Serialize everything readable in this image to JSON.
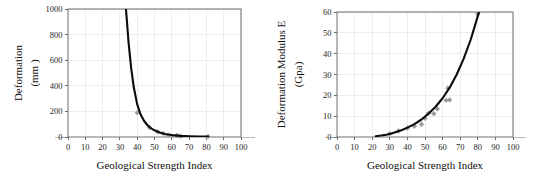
{
  "figure": {
    "title": "",
    "panel_count": 2
  },
  "chart_data": [
    {
      "type": "scatter",
      "panel": "left",
      "title": "",
      "xlabel": "Geological Strength Index",
      "ylabel": "Deformation",
      "ylabel_units": "(mm )",
      "xlim": [
        0,
        100
      ],
      "ylim": [
        0,
        1000
      ],
      "xticks": [
        0,
        10,
        20,
        30,
        40,
        50,
        60,
        70,
        80,
        90,
        100
      ],
      "yticks": [
        0,
        200,
        400,
        600,
        800,
        1000
      ],
      "grid": true,
      "legend": "none",
      "series": [
        {
          "name": "Deformation data points",
          "marker": "diamond",
          "marker_color": "#9a9a9c",
          "points": [
            {
              "x": 40,
              "y": 190
            },
            {
              "x": 47,
              "y": 75
            },
            {
              "x": 52,
              "y": 38
            },
            {
              "x": 55,
              "y": 28
            },
            {
              "x": 58,
              "y": 14
            },
            {
              "x": 63,
              "y": 12
            },
            {
              "x": 65,
              "y": 6
            },
            {
              "x": 81,
              "y": 3
            }
          ]
        },
        {
          "name": "Fitted deformation curve",
          "marker": "none",
          "line_color": "#0b0b0b",
          "points": [
            {
              "x": 33.5,
              "y": 1000
            },
            {
              "x": 35,
              "y": 740
            },
            {
              "x": 36.5,
              "y": 540
            },
            {
              "x": 38,
              "y": 390
            },
            {
              "x": 40,
              "y": 255
            },
            {
              "x": 42,
              "y": 175
            },
            {
              "x": 44,
              "y": 125
            },
            {
              "x": 46,
              "y": 92
            },
            {
              "x": 48,
              "y": 68
            },
            {
              "x": 50,
              "y": 52
            },
            {
              "x": 53,
              "y": 35
            },
            {
              "x": 56,
              "y": 24
            },
            {
              "x": 60,
              "y": 15
            },
            {
              "x": 65,
              "y": 9
            },
            {
              "x": 70,
              "y": 6
            },
            {
              "x": 75,
              "y": 4
            },
            {
              "x": 81,
              "y": 3
            }
          ]
        }
      ]
    },
    {
      "type": "scatter",
      "panel": "right",
      "title": "",
      "xlabel": "Geological Strength Index",
      "ylabel": "Deformation Modulus E",
      "ylabel_units": "(Gpa)",
      "xlim": [
        0,
        100
      ],
      "ylim": [
        0,
        60
      ],
      "xticks": [
        0,
        10,
        20,
        30,
        40,
        50,
        60,
        70,
        80,
        90,
        100
      ],
      "yticks": [
        0,
        10,
        20,
        30,
        40,
        50,
        60
      ],
      "grid": true,
      "legend": "none",
      "series": [
        {
          "name": "Deformation modulus data points",
          "marker": "diamond",
          "marker_color": "#9a9a9c",
          "points": [
            {
              "x": 30,
              "y": 1.6
            },
            {
              "x": 35,
              "y": 2.9
            },
            {
              "x": 40,
              "y": 4.3
            },
            {
              "x": 44,
              "y": 5.2
            },
            {
              "x": 48,
              "y": 6.1
            },
            {
              "x": 50,
              "y": 9.0
            },
            {
              "x": 52,
              "y": 11.5
            },
            {
              "x": 55,
              "y": 11.2
            },
            {
              "x": 57,
              "y": 13.5
            },
            {
              "x": 62,
              "y": 17.6
            },
            {
              "x": 64,
              "y": 17.8
            },
            {
              "x": 63,
              "y": 23.5
            },
            {
              "x": 80,
              "y": 59.0
            }
          ]
        },
        {
          "name": "Fitted modulus curve",
          "marker": "none",
          "line_color": "#0b0b0b",
          "points": [
            {
              "x": 22,
              "y": 0.4
            },
            {
              "x": 25,
              "y": 0.7
            },
            {
              "x": 28,
              "y": 1.1
            },
            {
              "x": 31,
              "y": 1.7
            },
            {
              "x": 34,
              "y": 2.5
            },
            {
              "x": 37,
              "y": 3.4
            },
            {
              "x": 40,
              "y": 4.5
            },
            {
              "x": 44,
              "y": 6.2
            },
            {
              "x": 48,
              "y": 8.4
            },
            {
              "x": 52,
              "y": 11.2
            },
            {
              "x": 56,
              "y": 14.5
            },
            {
              "x": 60,
              "y": 18.6
            },
            {
              "x": 64,
              "y": 23.7
            },
            {
              "x": 68,
              "y": 30.0
            },
            {
              "x": 72,
              "y": 37.6
            },
            {
              "x": 76,
              "y": 46.8
            },
            {
              "x": 80,
              "y": 58.0
            },
            {
              "x": 82,
              "y": 64.0
            }
          ]
        }
      ]
    }
  ]
}
